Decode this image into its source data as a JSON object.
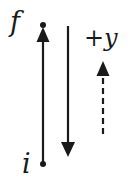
{
  "diagram": {
    "labels": {
      "final": "f",
      "initial": "i",
      "axis_sign": "+",
      "axis_var": "y"
    },
    "elements": [
      {
        "name": "upward-displacement-arrow",
        "from": "i",
        "to": "f",
        "direction": "up",
        "style": "solid"
      },
      {
        "name": "downward-arrow",
        "direction": "down",
        "style": "solid"
      },
      {
        "name": "positive-y-direction-arrow",
        "direction": "up",
        "style": "dashed"
      }
    ],
    "colors": {
      "stroke": "#1a1a1a",
      "background": "#ffffff"
    }
  }
}
